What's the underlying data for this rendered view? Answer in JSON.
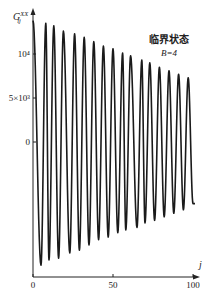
{
  "chart_data": {
    "type": "line",
    "title": "",
    "xlabel": "j",
    "ylabel": "G_ij^XX",
    "xlim": [
      0,
      100
    ],
    "ylim": [
      -15000,
      15000
    ],
    "x_ticks": [
      0,
      50,
      100
    ],
    "x_tick_labels": [
      "0",
      "50",
      "100"
    ],
    "y_ticks": [
      10000,
      5000,
      0
    ],
    "y_tick_labels": [
      "10⁴",
      "5×10³",
      "0"
    ],
    "grid": false,
    "annotations": [
      {
        "text": "临界状态",
        "position": "upper-right"
      },
      {
        "text": "B=4",
        "position": "upper-right"
      }
    ],
    "series": [
      {
        "name": "G_ij^XX",
        "description": "damped oscillation with decreasing envelope",
        "peaks": {
          "x": [
            8,
            13,
            19,
            26,
            32,
            38,
            44,
            50,
            56,
            61,
            68,
            73,
            79,
            85,
            91,
            97
          ],
          "y": [
            13500,
            13200,
            12600,
            12300,
            11900,
            11400,
            10900,
            10600,
            10100,
            9800,
            9300,
            9000,
            8500,
            8100,
            7700,
            7300
          ]
        },
        "troughs": {
          "x": [
            5,
            10,
            16,
            23,
            29,
            35,
            41,
            47,
            53,
            58,
            65,
            70,
            76,
            82,
            88,
            94
          ],
          "y": [
            -14000,
            -13400,
            -13200,
            -12600,
            -12300,
            -11700,
            -11100,
            -10800,
            -10300,
            -10000,
            -9700,
            -9200,
            -8900,
            -8500,
            -8100,
            -7700
          ]
        },
        "end_point": {
          "x": 100,
          "y": -7000
        }
      }
    ]
  },
  "axes": {
    "x_label": "j",
    "y_label_main": "G",
    "y_label_sup": "XX",
    "y_label_sub": "ij"
  },
  "legend": {
    "title": "临界状态",
    "param": "B=4"
  }
}
